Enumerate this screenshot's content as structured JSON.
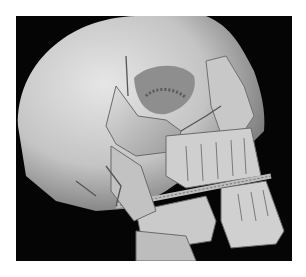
{
  "figure": {
    "background_color": "#050505",
    "bone_color": "#d8d8d8",
    "page_background": "#ffffff"
  }
}
